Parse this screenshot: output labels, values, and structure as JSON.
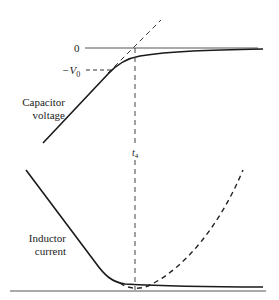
{
  "labels": {
    "zero": "0",
    "neg_v0_minus": "−V",
    "neg_v0_sub": "0",
    "capacitor_line1": "Capacitor",
    "capacitor_line2": "voltage",
    "t4_main": "t",
    "t4_sub": "4",
    "inductor_line1": "Inductor",
    "inductor_line2": "current"
  },
  "colors": {
    "stroke": "#1a1a1a",
    "axis": "#444444",
    "background": "#ffffff"
  }
}
